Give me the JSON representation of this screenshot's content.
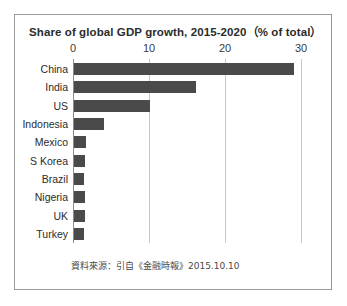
{
  "chart_data": {
    "type": "bar",
    "orientation": "horizontal",
    "title": "Share of global GDP growth, 2015-2020（% of total）",
    "xlabel": "",
    "ylabel": "",
    "categories": [
      "China",
      "India",
      "US",
      "Indonesia",
      "Mexico",
      "S Korea",
      "Brazil",
      "Nigeria",
      "UK",
      "Turkey"
    ],
    "values": [
      29,
      16,
      10,
      3.9,
      1.6,
      1.4,
      1.3,
      1.4,
      1.4,
      1.3
    ],
    "xlim": [
      0,
      30
    ],
    "xticks": [
      0,
      10,
      20,
      30
    ],
    "xtick_labels": [
      "0",
      "10",
      "20",
      "30"
    ],
    "grid": true,
    "legend": "none",
    "bar_color": "#4a4a4a",
    "gridline_color": "#c9c9c9",
    "axis_color": "#8c8c8c",
    "source_note": "資料來源：引自《金融時報》2015.10.10"
  },
  "panel": {
    "border_color": "#9a9a9a",
    "background": "#ffffff"
  }
}
